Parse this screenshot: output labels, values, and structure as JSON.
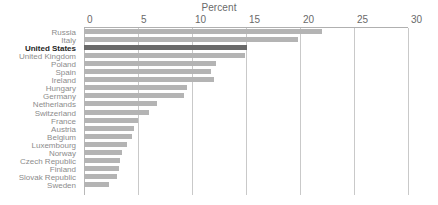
{
  "chart_data": {
    "type": "bar",
    "orientation": "horizontal",
    "title": "Percent",
    "xlabel": "Percent",
    "ylabel": "",
    "xlim": [
      0,
      30
    ],
    "xticks": [
      0,
      5,
      10,
      15,
      20,
      25,
      30
    ],
    "xtick_labels": [
      "0",
      "5",
      "10",
      "15",
      "20",
      "25",
      "30"
    ],
    "grid": true,
    "legend": false,
    "highlight_category": "United States",
    "colors": {
      "bar": "#b4b4b4",
      "bar_highlight": "#6a6a6a",
      "gridline": "#c9c9c9",
      "axis": "#b0b0b0",
      "label": "#8c8c8c",
      "label_highlight": "#1f1f1f",
      "background": "#ffffff"
    },
    "categories": [
      "Russia",
      "Italy",
      "United States",
      "United Kingdom",
      "Poland",
      "Spain",
      "Ireland",
      "Hungary",
      "Germany",
      "Netherlands",
      "Switzerland",
      "France",
      "Austria",
      "Belgium",
      "Luxembourg",
      "Norway",
      "Czech Republic",
      "Finland",
      "Slovak Republic",
      "Sweden"
    ],
    "values": [
      22.0,
      19.8,
      15.1,
      14.9,
      12.2,
      11.8,
      12.0,
      9.5,
      9.3,
      6.8,
      6.0,
      5.0,
      4.6,
      4.4,
      4.0,
      3.5,
      3.3,
      3.2,
      3.1,
      2.3
    ]
  }
}
